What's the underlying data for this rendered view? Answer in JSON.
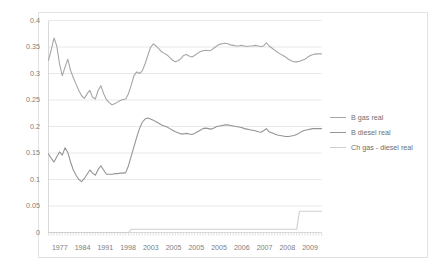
{
  "chart_data": {
    "type": "line",
    "title": "",
    "xlabel": "",
    "ylabel": "",
    "ylim": [
      0,
      0.4
    ],
    "yticks": [
      "0",
      "0.05",
      "0.1",
      "0.15",
      "0.2",
      "0.25",
      "0.3",
      "0.35",
      "0.4"
    ],
    "ytick_values": [
      0,
      0.05,
      0.1,
      0.15,
      0.2,
      0.25,
      0.3,
      0.35,
      0.4
    ],
    "xticks": [
      "1977",
      "1984",
      "1991",
      "1998",
      "2003",
      "2005",
      "2005",
      "2005",
      "2006",
      "2007",
      "2008",
      "2009"
    ],
    "grid": true,
    "legend_position": "right",
    "colors": {
      "b_gas_real": "#a6a6a6",
      "b_diesel_real": "#949494",
      "ch_gas_diesel_real": "#cfcfcf",
      "gridline": "#e8e8e8",
      "axis": "#d9d9d9",
      "tick_label": "#808080",
      "legend_text": "#6e6e6e",
      "frame_border": "#e2e2e2"
    },
    "series": [
      {
        "name": "B gas real",
        "color": "#a6a6a6",
        "values": [
          0.325,
          0.345,
          0.367,
          0.352,
          0.318,
          0.296,
          0.312,
          0.327,
          0.306,
          0.292,
          0.28,
          0.268,
          0.258,
          0.253,
          0.262,
          0.268,
          0.255,
          0.252,
          0.268,
          0.277,
          0.262,
          0.251,
          0.245,
          0.241,
          0.243,
          0.246,
          0.249,
          0.251,
          0.252,
          0.262,
          0.278,
          0.296,
          0.303,
          0.3,
          0.305,
          0.318,
          0.334,
          0.349,
          0.356,
          0.352,
          0.347,
          0.341,
          0.338,
          0.335,
          0.33,
          0.325,
          0.322,
          0.324,
          0.328,
          0.334,
          0.336,
          0.333,
          0.331,
          0.334,
          0.338,
          0.341,
          0.343,
          0.344,
          0.343,
          0.344,
          0.348,
          0.352,
          0.355,
          0.356,
          0.357,
          0.356,
          0.354,
          0.353,
          0.352,
          0.352,
          0.353,
          0.352,
          0.351,
          0.352,
          0.352,
          0.353,
          0.352,
          0.351,
          0.352,
          0.358,
          0.352,
          0.348,
          0.344,
          0.34,
          0.337,
          0.334,
          0.331,
          0.327,
          0.324,
          0.322,
          0.322,
          0.323,
          0.325,
          0.327,
          0.331,
          0.334,
          0.336,
          0.337,
          0.337,
          0.337
        ]
      },
      {
        "name": "B diesel real",
        "color": "#949494",
        "values": [
          0.148,
          0.14,
          0.133,
          0.143,
          0.152,
          0.146,
          0.16,
          0.151,
          0.133,
          0.118,
          0.108,
          0.1,
          0.096,
          0.102,
          0.11,
          0.118,
          0.112,
          0.108,
          0.119,
          0.126,
          0.118,
          0.11,
          0.11,
          0.11,
          0.111,
          0.111,
          0.112,
          0.112,
          0.113,
          0.126,
          0.144,
          0.162,
          0.18,
          0.196,
          0.208,
          0.214,
          0.216,
          0.214,
          0.212,
          0.209,
          0.206,
          0.203,
          0.201,
          0.199,
          0.196,
          0.193,
          0.19,
          0.188,
          0.186,
          0.186,
          0.187,
          0.186,
          0.185,
          0.187,
          0.19,
          0.193,
          0.196,
          0.197,
          0.196,
          0.195,
          0.197,
          0.2,
          0.201,
          0.202,
          0.203,
          0.203,
          0.202,
          0.201,
          0.2,
          0.199,
          0.198,
          0.196,
          0.195,
          0.194,
          0.193,
          0.192,
          0.19,
          0.189,
          0.192,
          0.196,
          0.19,
          0.188,
          0.186,
          0.184,
          0.183,
          0.182,
          0.181,
          0.181,
          0.182,
          0.183,
          0.185,
          0.188,
          0.191,
          0.193,
          0.194,
          0.195,
          0.196,
          0.196,
          0.196,
          0.196
        ]
      },
      {
        "name": "Ch gas - diesel real",
        "color": "#cfcfcf",
        "values": [
          0.0,
          0.0,
          0.0,
          0.0,
          0.0,
          0.0,
          0.0,
          0.0,
          0.0,
          0.0,
          0.0,
          0.0,
          0.0,
          0.0,
          0.0,
          0.0,
          0.0,
          0.0,
          0.0,
          0.0,
          0.0,
          0.0,
          0.0,
          0.0,
          0.0,
          0.0,
          0.0,
          0.0,
          0.0,
          0.0,
          0.006,
          0.006,
          0.006,
          0.006,
          0.006,
          0.006,
          0.006,
          0.006,
          0.006,
          0.006,
          0.006,
          0.006,
          0.006,
          0.006,
          0.006,
          0.006,
          0.006,
          0.006,
          0.006,
          0.006,
          0.006,
          0.006,
          0.006,
          0.006,
          0.006,
          0.006,
          0.006,
          0.006,
          0.006,
          0.006,
          0.006,
          0.006,
          0.006,
          0.006,
          0.006,
          0.006,
          0.006,
          0.006,
          0.006,
          0.006,
          0.006,
          0.006,
          0.006,
          0.006,
          0.006,
          0.006,
          0.006,
          0.006,
          0.006,
          0.006,
          0.006,
          0.006,
          0.006,
          0.006,
          0.006,
          0.006,
          0.006,
          0.006,
          0.006,
          0.006,
          0.006,
          0.04,
          0.04,
          0.04,
          0.04,
          0.04,
          0.04,
          0.04,
          0.04,
          0.04
        ]
      }
    ]
  },
  "legend": {
    "items": [
      {
        "label": "B gas real"
      },
      {
        "label": "B diesel real"
      },
      {
        "label": "Ch gas - diesel real"
      }
    ]
  }
}
